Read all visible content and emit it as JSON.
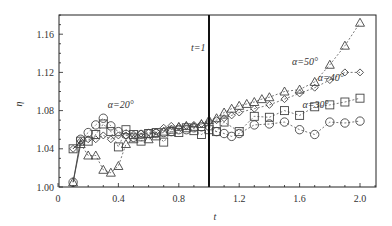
{
  "chart_data": {
    "type": "line",
    "title": "",
    "xlabel": "t",
    "ylabel": "η",
    "xlim": [
      0,
      2.1
    ],
    "ylim": [
      1.0,
      1.18
    ],
    "xticks": [
      "0",
      "0.4",
      "0.8",
      "1.2",
      "1.6",
      "2.0"
    ],
    "yticks": [
      "1.00",
      "1.04",
      "1.08",
      "1.12",
      "1.16"
    ],
    "grid": false,
    "legend": "inline annotations",
    "vline": {
      "x": 1.0,
      "label": "t=1"
    },
    "series": [
      {
        "name": "α=20°",
        "marker": "circle",
        "x": [
          0.1,
          0.15,
          0.2,
          0.25,
          0.3,
          0.35,
          0.4,
          0.45,
          0.5,
          0.55,
          0.6,
          0.65,
          0.7,
          0.75,
          0.8,
          0.85,
          0.9,
          0.95,
          1.0,
          1.05,
          1.1,
          1.15,
          1.2,
          1.3,
          1.4,
          1.5,
          1.6,
          1.7,
          1.8,
          1.9,
          2.0
        ],
        "y": [
          1.005,
          1.05,
          1.057,
          1.065,
          1.072,
          1.064,
          1.058,
          1.055,
          1.052,
          1.055,
          1.056,
          1.056,
          1.057,
          1.058,
          1.06,
          1.06,
          1.062,
          1.063,
          1.064,
          1.058,
          1.056,
          1.053,
          1.056,
          1.065,
          1.066,
          1.068,
          1.06,
          1.055,
          1.068,
          1.067,
          1.069
        ]
      },
      {
        "name": "α=30°",
        "marker": "square",
        "x": [
          0.1,
          0.15,
          0.2,
          0.25,
          0.3,
          0.35,
          0.4,
          0.45,
          0.5,
          0.55,
          0.6,
          0.65,
          0.7,
          0.75,
          0.8,
          0.85,
          0.9,
          0.95,
          1.0,
          1.05,
          1.1,
          1.2,
          1.3,
          1.4,
          1.5,
          1.6,
          1.7,
          1.8,
          1.9,
          2.0
        ],
        "y": [
          1.04,
          1.048,
          1.048,
          1.055,
          1.066,
          1.058,
          1.042,
          1.06,
          1.055,
          1.048,
          1.056,
          1.057,
          1.047,
          1.058,
          1.057,
          1.062,
          1.059,
          1.055,
          1.06,
          1.058,
          1.068,
          1.058,
          1.074,
          1.073,
          1.08,
          1.075,
          1.084,
          1.086,
          1.089,
          1.093
        ]
      },
      {
        "name": "α=40°",
        "marker": "diamond",
        "x": [
          0.1,
          0.15,
          0.2,
          0.25,
          0.3,
          0.35,
          0.4,
          0.45,
          0.5,
          0.55,
          0.6,
          0.65,
          0.7,
          0.75,
          0.8,
          0.85,
          0.9,
          0.95,
          1.0,
          1.05,
          1.1,
          1.15,
          1.2,
          1.3,
          1.4,
          1.5,
          1.6,
          1.7,
          1.8,
          1.9,
          2.0
        ],
        "y": [
          1.04,
          1.048,
          1.05,
          1.05,
          1.054,
          1.05,
          1.054,
          1.054,
          1.055,
          1.056,
          1.057,
          1.058,
          1.062,
          1.064,
          1.063,
          1.064,
          1.065,
          1.066,
          1.068,
          1.07,
          1.072,
          1.075,
          1.078,
          1.082,
          1.086,
          1.092,
          1.098,
          1.104,
          1.112,
          1.12,
          1.12
        ]
      },
      {
        "name": "α=50°",
        "marker": "triangle",
        "x": [
          0.1,
          0.15,
          0.2,
          0.25,
          0.3,
          0.35,
          0.4,
          0.45,
          0.5,
          0.55,
          0.6,
          0.65,
          0.7,
          0.75,
          0.8,
          0.85,
          0.9,
          0.95,
          1.0,
          1.05,
          1.1,
          1.15,
          1.2,
          1.25,
          1.3,
          1.35,
          1.4,
          1.5,
          1.6,
          1.7,
          1.8,
          1.9,
          2.0
        ],
        "y": [
          1.005,
          1.045,
          1.033,
          1.033,
          1.018,
          1.015,
          1.022,
          1.045,
          1.05,
          1.052,
          1.05,
          1.053,
          1.058,
          1.06,
          1.063,
          1.064,
          1.063,
          1.066,
          1.07,
          1.072,
          1.078,
          1.082,
          1.085,
          1.087,
          1.089,
          1.092,
          1.094,
          1.1,
          1.102,
          1.11,
          1.128,
          1.148,
          1.172
        ]
      }
    ],
    "annotations": [
      {
        "text": "α=20°",
        "x": 0.33,
        "y": 1.083
      },
      {
        "text": "α=30°",
        "x": 1.62,
        "y": 1.083
      },
      {
        "text": "α=40°",
        "x": 1.72,
        "y": 1.111
      },
      {
        "text": "α=50°",
        "x": 1.55,
        "y": 1.128
      },
      {
        "text": "t=1",
        "x": 0.88,
        "y": 1.142
      }
    ]
  }
}
